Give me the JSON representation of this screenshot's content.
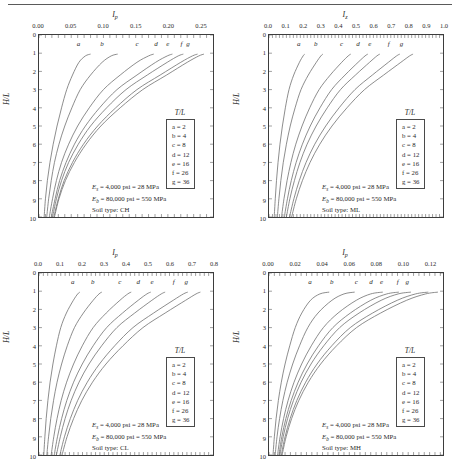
{
  "figure": {
    "panel_count": 4,
    "legend_title": "T/L",
    "ylabel": "H/L",
    "y_ticks": [
      "0",
      "1",
      "2",
      "3",
      "4",
      "5",
      "6",
      "7",
      "8",
      "9",
      "10"
    ],
    "legend_entries": [
      {
        "key": "a",
        "value": "a = 2"
      },
      {
        "key": "b",
        "value": "b = 4"
      },
      {
        "key": "c",
        "value": "c = 8"
      },
      {
        "key": "d",
        "value": "d = 12"
      },
      {
        "key": "e",
        "value": "e = 16"
      },
      {
        "key": "f",
        "value": "f = 26"
      },
      {
        "key": "g",
        "value": "g = 36"
      }
    ],
    "note_es": "= 4,000 psi = 28 MPa",
    "note_eb": "= 80,000 psi = 550 MPa",
    "es_symbol": "E",
    "es_sub": "s",
    "eb_symbol": "E",
    "eb_sub": "b",
    "curve_labels": [
      "a",
      "b",
      "c",
      "d",
      "e",
      "f",
      "g"
    ],
    "line_color": "#6e6e6e",
    "axis_color": "#3d3d3d"
  },
  "chart_data": [
    {
      "type": "line",
      "title": "Soil type: CH",
      "xlabel": "I",
      "xlabel_sub": "p",
      "ylabel": "H/L",
      "xlim": [
        0.0,
        0.27
      ],
      "ylim": [
        10,
        0
      ],
      "xticks": [
        0.0,
        0.05,
        0.1,
        0.15,
        0.2,
        0.25
      ],
      "xticklabels": [
        "0.00",
        "0.05",
        "0.10",
        "0.15",
        "0.20",
        "0.25"
      ],
      "yticks": [
        0,
        1,
        2,
        3,
        4,
        5,
        6,
        7,
        8,
        9,
        10
      ],
      "grid": false,
      "legend_position": "right-middle",
      "soil_type": "CH",
      "series": [
        {
          "name": "a",
          "tl": 2,
          "x": [
            0.008,
            0.01,
            0.013,
            0.017,
            0.022,
            0.028,
            0.035,
            0.043,
            0.052,
            0.062,
            0.072,
            0.08
          ],
          "y": [
            10,
            9,
            8,
            7,
            6,
            5,
            4,
            3,
            2.2,
            1.5,
            1.15,
            1.05
          ]
        },
        {
          "name": "b",
          "tl": 4,
          "x": [
            0.012,
            0.015,
            0.019,
            0.024,
            0.031,
            0.04,
            0.051,
            0.064,
            0.08,
            0.098,
            0.112,
            0.122
          ],
          "y": [
            10,
            9,
            8,
            7,
            6,
            5,
            4,
            3,
            2.2,
            1.5,
            1.15,
            1.05
          ]
        },
        {
          "name": "c",
          "tl": 8,
          "x": [
            0.016,
            0.021,
            0.027,
            0.035,
            0.046,
            0.06,
            0.078,
            0.1,
            0.126,
            0.152,
            0.17,
            0.178
          ],
          "y": [
            10,
            9,
            8,
            7,
            6,
            5,
            4,
            3,
            2.2,
            1.5,
            1.15,
            1.05
          ]
        },
        {
          "name": "d",
          "tl": 12,
          "x": [
            0.019,
            0.025,
            0.032,
            0.042,
            0.055,
            0.072,
            0.094,
            0.121,
            0.152,
            0.181,
            0.199,
            0.207
          ],
          "y": [
            10,
            9,
            8,
            7,
            6,
            5,
            4,
            3,
            2.2,
            1.5,
            1.15,
            1.05
          ]
        },
        {
          "name": "e",
          "tl": 16,
          "x": [
            0.021,
            0.027,
            0.035,
            0.046,
            0.061,
            0.08,
            0.105,
            0.135,
            0.168,
            0.199,
            0.216,
            0.224
          ],
          "y": [
            10,
            9,
            8,
            7,
            6,
            5,
            4,
            3,
            2.2,
            1.5,
            1.15,
            1.05
          ]
        },
        {
          "name": "f",
          "tl": 26,
          "x": [
            0.023,
            0.03,
            0.039,
            0.052,
            0.069,
            0.091,
            0.119,
            0.152,
            0.188,
            0.22,
            0.238,
            0.246
          ],
          "y": [
            10,
            9,
            8,
            7,
            6,
            5,
            4,
            3,
            2.2,
            1.5,
            1.15,
            1.05
          ]
        },
        {
          "name": "g",
          "tl": 36,
          "x": [
            0.024,
            0.031,
            0.041,
            0.055,
            0.073,
            0.096,
            0.126,
            0.161,
            0.198,
            0.23,
            0.248,
            0.256
          ],
          "y": [
            10,
            9,
            8,
            7,
            6,
            5,
            4,
            3,
            2.2,
            1.5,
            1.15,
            1.05
          ]
        }
      ]
    },
    {
      "type": "line",
      "title": "Soil type: ML",
      "xlabel": "I",
      "xlabel_sub": "z",
      "ylabel": "H/L",
      "xlim": [
        0.0,
        1.0
      ],
      "ylim": [
        10,
        0
      ],
      "xticks": [
        0.0,
        0.1,
        0.2,
        0.3,
        0.4,
        0.5,
        0.6,
        0.7,
        0.8,
        0.9,
        1.0
      ],
      "xticklabels": [
        "0.0",
        "0.1",
        "0.2",
        "0.3",
        "0.4",
        "0.5",
        "0.6",
        "0.7",
        "0.8",
        "0.9",
        "1.0"
      ],
      "yticks": [
        0,
        1,
        2,
        3,
        4,
        5,
        6,
        7,
        8,
        9,
        10
      ],
      "grid": false,
      "legend_position": "right-middle",
      "soil_type": "ML",
      "series": [
        {
          "name": "a",
          "tl": 2,
          "x": [
            0.03,
            0.036,
            0.043,
            0.052,
            0.063,
            0.077,
            0.094,
            0.115,
            0.142,
            0.175,
            0.196,
            0.205
          ],
          "y": [
            10,
            9,
            8,
            7,
            6,
            5,
            4,
            3,
            2.2,
            1.5,
            1.15,
            1.05
          ]
        },
        {
          "name": "b",
          "tl": 4,
          "x": [
            0.048,
            0.057,
            0.068,
            0.082,
            0.1,
            0.122,
            0.15,
            0.184,
            0.226,
            0.272,
            0.298,
            0.31
          ],
          "y": [
            10,
            9,
            8,
            7,
            6,
            5,
            4,
            3,
            2.2,
            1.5,
            1.15,
            1.05
          ]
        },
        {
          "name": "c",
          "tl": 8,
          "x": [
            0.072,
            0.086,
            0.104,
            0.126,
            0.154,
            0.19,
            0.234,
            0.288,
            0.352,
            0.418,
            0.455,
            0.47
          ],
          "y": [
            10,
            9,
            8,
            7,
            6,
            5,
            4,
            3,
            2.2,
            1.5,
            1.15,
            1.05
          ]
        },
        {
          "name": "d",
          "tl": 12,
          "x": [
            0.088,
            0.106,
            0.128,
            0.156,
            0.192,
            0.237,
            0.293,
            0.36,
            0.437,
            0.512,
            0.552,
            0.568
          ],
          "y": [
            10,
            9,
            8,
            7,
            6,
            5,
            4,
            3,
            2.2,
            1.5,
            1.15,
            1.05
          ]
        },
        {
          "name": "e",
          "tl": 16,
          "x": [
            0.1,
            0.12,
            0.146,
            0.178,
            0.219,
            0.271,
            0.335,
            0.411,
            0.497,
            0.578,
            0.62,
            0.637
          ],
          "y": [
            10,
            9,
            8,
            7,
            6,
            5,
            4,
            3,
            2.2,
            1.5,
            1.15,
            1.05
          ]
        },
        {
          "name": "f",
          "tl": 26,
          "x": [
            0.118,
            0.143,
            0.174,
            0.213,
            0.263,
            0.326,
            0.403,
            0.494,
            0.594,
            0.686,
            0.733,
            0.752
          ],
          "y": [
            10,
            9,
            8,
            7,
            6,
            5,
            4,
            3,
            2.2,
            1.5,
            1.15,
            1.05
          ]
        },
        {
          "name": "g",
          "tl": 36,
          "x": [
            0.13,
            0.157,
            0.192,
            0.236,
            0.292,
            0.362,
            0.448,
            0.549,
            0.659,
            0.758,
            0.808,
            0.828
          ],
          "y": [
            10,
            9,
            8,
            7,
            6,
            5,
            4,
            3,
            2.2,
            1.5,
            1.15,
            1.05
          ]
        }
      ]
    },
    {
      "type": "line",
      "title": "Soil type: CL",
      "xlabel": "I",
      "xlabel_sub": "p",
      "ylabel": "H/L",
      "xlim": [
        0.0,
        0.8
      ],
      "ylim": [
        10,
        0
      ],
      "xticks": [
        0.0,
        0.1,
        0.2,
        0.3,
        0.4,
        0.5,
        0.6,
        0.7,
        0.8
      ],
      "xticklabels": [
        "0.0",
        "0.1",
        "0.2",
        "0.3",
        "0.4",
        "0.5",
        "0.6",
        "0.7",
        "0.8"
      ],
      "yticks": [
        0,
        1,
        2,
        3,
        4,
        5,
        6,
        7,
        8,
        9,
        10
      ],
      "grid": false,
      "legend_position": "right-middle",
      "soil_type": "CL",
      "series": [
        {
          "name": "a",
          "tl": 2,
          "x": [
            0.022,
            0.027,
            0.033,
            0.041,
            0.051,
            0.064,
            0.08,
            0.1,
            0.126,
            0.158,
            0.178,
            0.188
          ],
          "y": [
            10,
            9,
            8,
            7,
            6,
            5,
            4,
            3,
            2.2,
            1.5,
            1.15,
            1.05
          ]
        },
        {
          "name": "b",
          "tl": 4,
          "x": [
            0.036,
            0.044,
            0.054,
            0.067,
            0.083,
            0.104,
            0.13,
            0.163,
            0.204,
            0.249,
            0.276,
            0.289
          ],
          "y": [
            10,
            9,
            8,
            7,
            6,
            5,
            4,
            3,
            2.2,
            1.5,
            1.15,
            1.05
          ]
        },
        {
          "name": "c",
          "tl": 8,
          "x": [
            0.056,
            0.068,
            0.083,
            0.102,
            0.127,
            0.159,
            0.199,
            0.249,
            0.309,
            0.372,
            0.408,
            0.424
          ],
          "y": [
            10,
            9,
            8,
            7,
            6,
            5,
            4,
            3,
            2.2,
            1.5,
            1.15,
            1.05
          ]
        },
        {
          "name": "d",
          "tl": 12,
          "x": [
            0.07,
            0.085,
            0.104,
            0.128,
            0.159,
            0.199,
            0.249,
            0.311,
            0.384,
            0.456,
            0.496,
            0.514
          ],
          "y": [
            10,
            9,
            8,
            7,
            6,
            5,
            4,
            3,
            2.2,
            1.5,
            1.15,
            1.05
          ]
        },
        {
          "name": "e",
          "tl": 16,
          "x": [
            0.08,
            0.098,
            0.12,
            0.148,
            0.184,
            0.23,
            0.288,
            0.358,
            0.44,
            0.519,
            0.562,
            0.58
          ],
          "y": [
            10,
            9,
            8,
            7,
            6,
            5,
            4,
            3,
            2.2,
            1.5,
            1.15,
            1.05
          ]
        },
        {
          "name": "f",
          "tl": 26,
          "x": [
            0.096,
            0.117,
            0.144,
            0.178,
            0.222,
            0.278,
            0.348,
            0.432,
            0.527,
            0.617,
            0.664,
            0.684
          ],
          "y": [
            10,
            9,
            8,
            7,
            6,
            5,
            4,
            3,
            2.2,
            1.5,
            1.15,
            1.05
          ]
        },
        {
          "name": "g",
          "tl": 36,
          "x": [
            0.106,
            0.129,
            0.159,
            0.197,
            0.246,
            0.308,
            0.386,
            0.478,
            0.58,
            0.674,
            0.722,
            0.742
          ],
          "y": [
            10,
            9,
            8,
            7,
            6,
            5,
            4,
            3,
            2.2,
            1.5,
            1.15,
            1.05
          ]
        }
      ]
    },
    {
      "type": "line",
      "title": "Soil type: MH",
      "xlabel": "I",
      "xlabel_sub": "p",
      "ylabel": "H/L",
      "xlim": [
        0.0,
        0.13
      ],
      "ylim": [
        10,
        0
      ],
      "xticks": [
        0.0,
        0.02,
        0.04,
        0.06,
        0.08,
        0.1,
        0.12
      ],
      "xticklabels": [
        "0.00",
        "0.02",
        "0.04",
        "0.06",
        "0.08",
        "0.10",
        "0.12"
      ],
      "yticks": [
        0,
        1,
        2,
        3,
        4,
        5,
        6,
        7,
        8,
        9,
        10
      ],
      "grid": false,
      "legend_position": "right-middle",
      "soil_type": "MH",
      "series": [
        {
          "name": "a",
          "tl": 2,
          "x": [
            0.003,
            0.004,
            0.0053,
            0.007,
            0.0092,
            0.012,
            0.0155,
            0.0196,
            0.0245,
            0.031,
            0.038,
            0.045
          ],
          "y": [
            10,
            9,
            8,
            7,
            6,
            5,
            4,
            3,
            2.2,
            1.5,
            1.15,
            1.05
          ]
        },
        {
          "name": "b",
          "tl": 4,
          "x": [
            0.0046,
            0.006,
            0.0079,
            0.0104,
            0.0136,
            0.0177,
            0.0228,
            0.029,
            0.0366,
            0.047,
            0.056,
            0.064
          ],
          "y": [
            10,
            9,
            8,
            7,
            6,
            5,
            4,
            3,
            2.2,
            1.5,
            1.15,
            1.05
          ]
        },
        {
          "name": "c",
          "tl": 8,
          "x": [
            0.0064,
            0.0083,
            0.0109,
            0.0143,
            0.0187,
            0.0244,
            0.0316,
            0.0406,
            0.0516,
            0.0652,
            0.076,
            0.085
          ],
          "y": [
            10,
            9,
            8,
            7,
            6,
            5,
            4,
            3,
            2.2,
            1.5,
            1.15,
            1.05
          ]
        },
        {
          "name": "d",
          "tl": 12,
          "x": [
            0.0074,
            0.0096,
            0.0126,
            0.0166,
            0.0218,
            0.0285,
            0.037,
            0.0477,
            0.0608,
            0.076,
            0.088,
            0.097
          ],
          "y": [
            10,
            9,
            8,
            7,
            6,
            5,
            4,
            3,
            2.2,
            1.5,
            1.15,
            1.05
          ]
        },
        {
          "name": "e",
          "tl": 16,
          "x": [
            0.0081,
            0.0106,
            0.0139,
            0.0183,
            0.024,
            0.0314,
            0.0409,
            0.0528,
            0.0673,
            0.0838,
            0.0965,
            0.106
          ],
          "y": [
            10,
            9,
            8,
            7,
            6,
            5,
            4,
            3,
            2.2,
            1.5,
            1.15,
            1.05
          ]
        },
        {
          "name": "f",
          "tl": 26,
          "x": [
            0.0092,
            0.012,
            0.0158,
            0.0208,
            0.0274,
            0.0359,
            0.0469,
            0.0607,
            0.0774,
            0.0958,
            0.1095,
            0.119
          ],
          "y": [
            10,
            9,
            8,
            7,
            6,
            5,
            4,
            3,
            2.2,
            1.5,
            1.15,
            1.05
          ]
        },
        {
          "name": "g",
          "tl": 36,
          "x": [
            0.0098,
            0.0128,
            0.0169,
            0.0223,
            0.0294,
            0.0386,
            0.0505,
            0.0654,
            0.0834,
            0.1028,
            0.117,
            0.1262
          ],
          "y": [
            10,
            9,
            8,
            7,
            6,
            5,
            4,
            3,
            2.2,
            1.5,
            1.15,
            1.05
          ]
        }
      ]
    }
  ]
}
